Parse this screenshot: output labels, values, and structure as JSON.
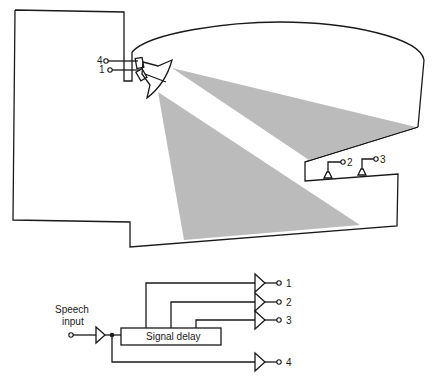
{
  "diagram": {
    "title": "",
    "hall": {
      "loudspeaker_inputs": [
        "4",
        "1"
      ],
      "balcony_speaker_inputs": [
        "2",
        "3"
      ]
    },
    "circuit": {
      "input_label_line1": "Speech",
      "input_label_line2": "input",
      "delay_label": "Signal delay",
      "outputs": [
        "1",
        "2",
        "3",
        "4"
      ]
    },
    "colors": {
      "line": "#1a1a1a",
      "beam": "#b4b4b4",
      "background": "#ffffff"
    }
  }
}
